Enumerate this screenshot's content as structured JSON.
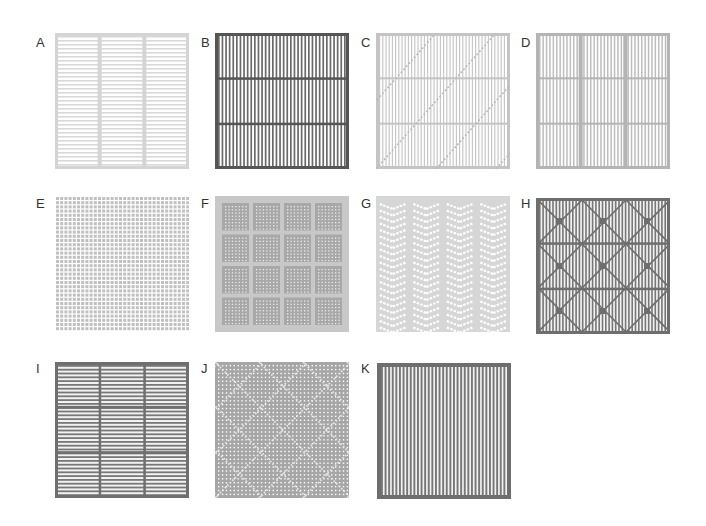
{
  "figure": {
    "panels": [
      {
        "id": "A",
        "label": "A",
        "pattern": "horizontal-stripes-3-columns",
        "frame_color": "#d4d4d4",
        "line_color": "#d9d9d9"
      },
      {
        "id": "B",
        "label": "B",
        "pattern": "vertical-stripes-3-rows",
        "frame_color": "#555555",
        "line_color": "#6a6a6a"
      },
      {
        "id": "C",
        "label": "C",
        "pattern": "vertical-stripes-3-rows-diagonals",
        "frame_color": "#c4c4c4",
        "line_color": "#c8c8c8"
      },
      {
        "id": "D",
        "label": "D",
        "pattern": "vertical-stripes-3x3-grid",
        "frame_color": "#b4b4b4",
        "line_color": "#bdbdbd"
      },
      {
        "id": "E",
        "label": "E",
        "pattern": "square-dot-grid",
        "frame_color": "#ffffff",
        "line_color": "#c0c0c0"
      },
      {
        "id": "F",
        "label": "F",
        "pattern": "4x4-blocks-dot-arrays",
        "frame_color": "#c8c8c8",
        "line_color": "#a8a8a8"
      },
      {
        "id": "G",
        "label": "G",
        "pattern": "chevron-columns",
        "frame_color": "#d6d6d6",
        "line_color": "#ffffff"
      },
      {
        "id": "H",
        "label": "H",
        "pattern": "vertical-stripes-diamond-lattice",
        "frame_color": "#6e6e6e",
        "line_color": "#777777"
      },
      {
        "id": "I",
        "label": "I",
        "pattern": "horizontal-stripes-3x3-grid",
        "frame_color": "#6f6f6f",
        "line_color": "#787878"
      },
      {
        "id": "J",
        "label": "J",
        "pattern": "dot-grid-diagonal-crosses",
        "frame_color": "#a6a6a6",
        "line_color": "#ffffff"
      },
      {
        "id": "K",
        "label": "K",
        "pattern": "vertical-stripes",
        "frame_color": "#6e6e6e",
        "line_color": "#777777"
      }
    ]
  }
}
